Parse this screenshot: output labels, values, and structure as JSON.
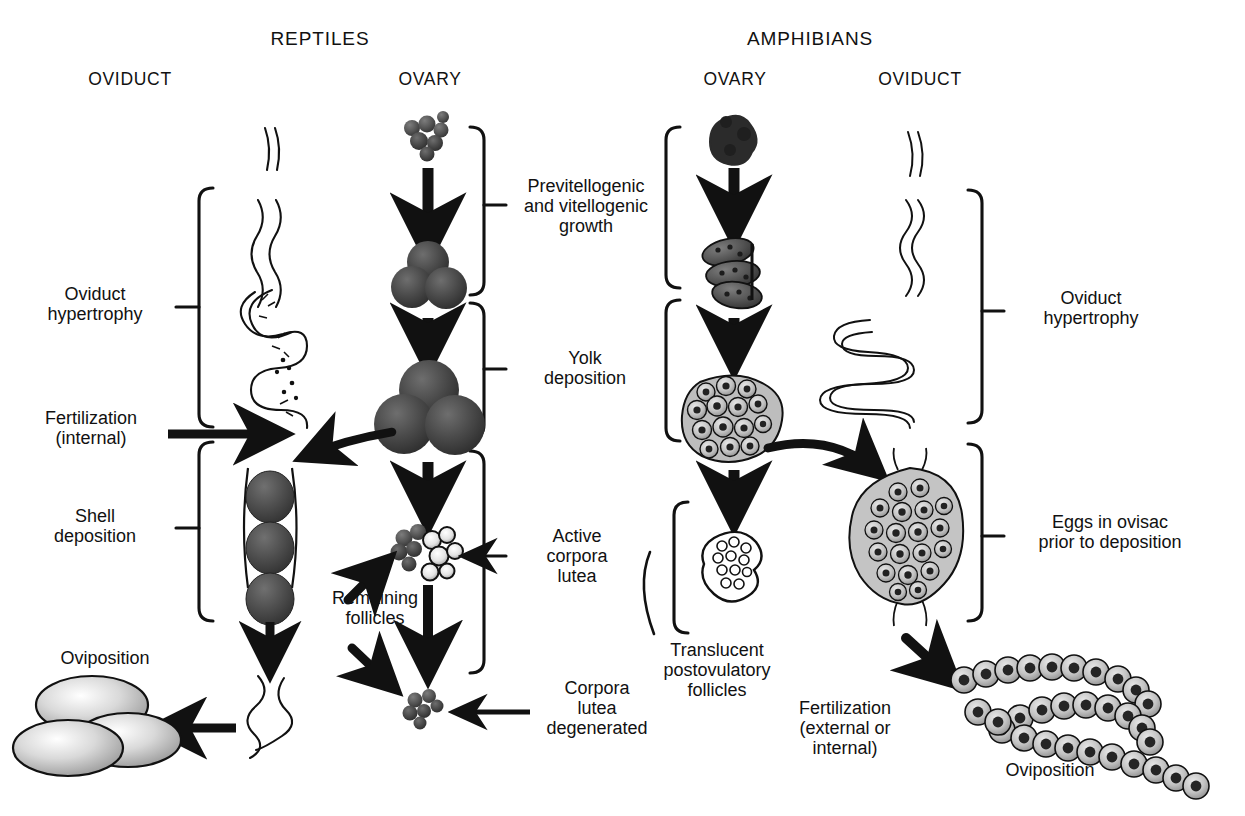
{
  "figure": {
    "domain": "biological-diagram",
    "title_visible": false,
    "background": "#ffffff",
    "ink": "#111111"
  },
  "columns": {
    "reptiles": {
      "group_label": "REPTILES",
      "left_header": "OVIDUCT",
      "right_header": "OVARY"
    },
    "amphibians": {
      "group_label": "AMPHIBIANS",
      "left_header": "OVARY",
      "right_header": "OVIDUCT"
    }
  },
  "labels": {
    "reptile_oviduct_hypertrophy": "Oviduct\nhypertrophy",
    "reptile_fertilization": "Fertilization\n(internal)",
    "reptile_shell_deposition": "Shell\ndeposition",
    "reptile_oviposition": "Oviposition",
    "previtellogenic_growth": "Previtellogenic\nand vitellogenic\ngrowth",
    "yolk_deposition": "Yolk\ndeposition",
    "active_corpora_lutea": "Active\ncorpora\nlutea",
    "remaining_follicles": "Remaining\nfollicles",
    "corpora_lutea_degenerated": "Corpora\nlutea\ndegenerated",
    "translucent_postovulatory": "Translucent\npostovulatory\nfollicles",
    "amphibian_oviduct_hypertrophy": "Oviduct\nhypertrophy",
    "eggs_in_ovisac": "Eggs in ovisac\nprior to deposition",
    "amphibian_fertilization": "Fertilization\n(external or\ninternal)",
    "amphibian_oviposition": "Oviposition"
  },
  "colors": {
    "follicle_dark": "#3f3f3f",
    "follicle_mid": "#5c5c5c",
    "egg_light": "#d8d8d8",
    "egg_shade": "#9a9a9a",
    "outline": "#111111"
  },
  "stages": {
    "reptile_ovary": [
      {
        "name": "previtellogenic-cluster",
        "size": "small"
      },
      {
        "name": "vitellogenic-triad",
        "size": "medium"
      },
      {
        "name": "yolk-laden-triad",
        "size": "large"
      },
      {
        "name": "corpora-lutea-and-follicles",
        "size": "mixed"
      },
      {
        "name": "degenerated-corpora-lutea",
        "size": "small"
      }
    ],
    "reptile_oviduct": [
      {
        "name": "thin-oviduct"
      },
      {
        "name": "wavy-oviduct"
      },
      {
        "name": "convoluted-oviduct"
      },
      {
        "name": "eggs-in-oviduct",
        "egg_count": 3
      },
      {
        "name": "postoviposition-oviduct"
      },
      {
        "name": "deposited-eggs",
        "egg_count": 3
      }
    ],
    "amphibian_ovary": [
      {
        "name": "previtellogenic-mass"
      },
      {
        "name": "vitellogenic-lobes"
      },
      {
        "name": "yolk-laden-ovary"
      },
      {
        "name": "postovulatory-follicles"
      }
    ],
    "amphibian_oviduct": [
      {
        "name": "thin-oviduct"
      },
      {
        "name": "wavy-oviduct"
      },
      {
        "name": "coiled-hypertrophied-oviduct"
      },
      {
        "name": "ovisac-with-eggs"
      },
      {
        "name": "egg-strand"
      }
    ]
  }
}
